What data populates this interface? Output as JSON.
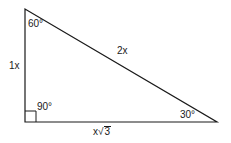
{
  "diagram": {
    "type": "right-triangle-30-60-90",
    "stroke_color": "#1a1a1a",
    "background": "#ffffff",
    "vertices": {
      "top": {
        "x": 25,
        "y": 9
      },
      "bottom_left": {
        "x": 25,
        "y": 122
      },
      "bottom_right": {
        "x": 217,
        "y": 122
      }
    },
    "angles": {
      "top": "60°",
      "bottom_left": "90°",
      "bottom_right": "30°"
    },
    "sides": {
      "left": "1x",
      "hypotenuse": "2x",
      "bottom_coef": "x",
      "bottom_radicand": "3"
    }
  }
}
